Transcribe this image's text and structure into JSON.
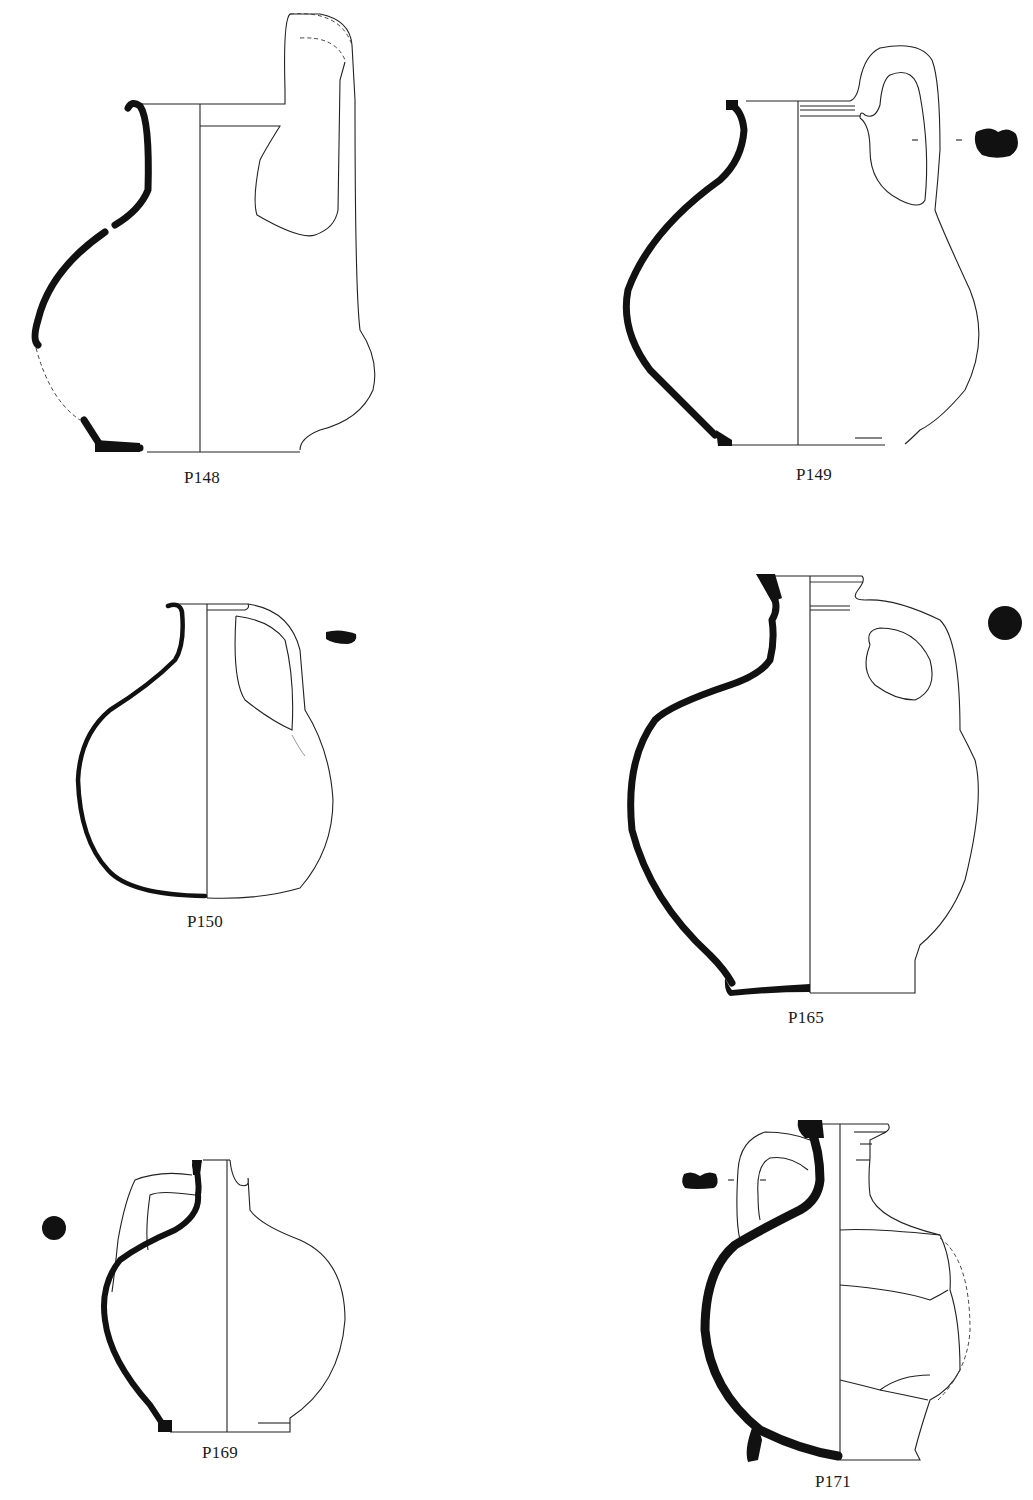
{
  "page": {
    "type": "archaeological pottery drawing plate",
    "background": "#ffffff",
    "ink_color": "#111111"
  },
  "figures": [
    {
      "id": "P148",
      "label": "P148",
      "vessel": "jug",
      "section_style": "profile with restored dashed segments",
      "handle_section": "none shown"
    },
    {
      "id": "P149",
      "label": "P149",
      "vessel": "jug",
      "section_style": "full profile",
      "handle_section": "kidney-shaped"
    },
    {
      "id": "P150",
      "label": "P150",
      "vessel": "flask jug",
      "section_style": "full profile",
      "handle_section": "flat oval"
    },
    {
      "id": "P165",
      "label": "P165",
      "vessel": "jug",
      "section_style": "full profile",
      "handle_section": "round"
    },
    {
      "id": "P169",
      "label": "P169",
      "vessel": "jug",
      "section_style": "full profile",
      "handle_section": "round"
    },
    {
      "id": "P171",
      "label": "P171",
      "vessel": "jug",
      "section_style": "profile with restored dashed segment",
      "handle_section": "kidney-shaped"
    }
  ]
}
